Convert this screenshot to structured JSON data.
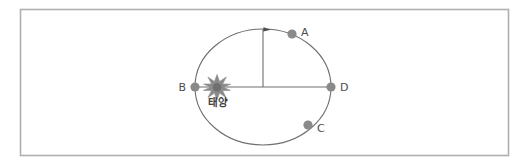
{
  "figure": {
    "title": "",
    "type": "orbit-diagram",
    "frame": {
      "x": 20,
      "y": 9,
      "width": 488,
      "height": 146,
      "border_color": "#b0b0b0",
      "background_color": "#ffffff"
    },
    "orbit": {
      "name": "elliptical-orbit",
      "center_x": 263,
      "center_y": 87,
      "radius_x": 68,
      "radius_y": 58,
      "stroke_color": "#6e6e6e",
      "stroke_width": 1.1
    },
    "sun": {
      "label": "태양",
      "label_x": 218,
      "label_y": 106,
      "x": 217,
      "y": 87,
      "color": "#7d7d7d",
      "icon": "sun-starburst-icon"
    },
    "axis_line": {
      "name": "major-axis-line",
      "x1": 195,
      "y1": 87,
      "x2": 331,
      "y2": 87,
      "color": "#6e6e6e"
    },
    "radius_line": {
      "name": "vertical-radius-line",
      "x1": 263,
      "y1": 29,
      "x2": 263,
      "y2": 87,
      "color": "#6e6e6e"
    },
    "direction_arrow": {
      "name": "orbit-direction-arrow",
      "x": 266,
      "y": 30,
      "points_toward": "A",
      "color": "#4d4d4d"
    },
    "points": [
      {
        "id": "A",
        "label": "A",
        "x": 292,
        "y": 34,
        "label_x": 301,
        "label_y": 32,
        "radius": 4.6,
        "color": "#8a8a8a"
      },
      {
        "id": "B",
        "label": "B",
        "x": 195,
        "y": 87,
        "label_x": 184,
        "label_y": 91,
        "radius": 4.6,
        "color": "#8a8a8a"
      },
      {
        "id": "C",
        "label": "C",
        "x": 308,
        "y": 125,
        "label_x": 317,
        "label_y": 132,
        "radius": 4.6,
        "color": "#8a8a8a"
      },
      {
        "id": "D",
        "label": "D",
        "x": 331,
        "y": 87,
        "label_x": 340,
        "label_y": 91,
        "radius": 4.6,
        "color": "#8a8a8a"
      }
    ]
  }
}
